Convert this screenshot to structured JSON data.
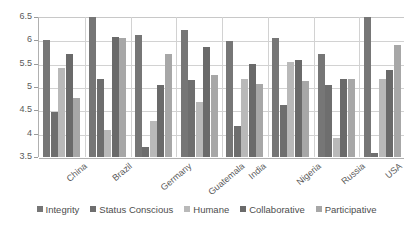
{
  "chart_data": {
    "type": "bar",
    "title": "",
    "subtitle": "",
    "xlabel": "",
    "ylabel": "",
    "ylim": [
      3.5,
      6.5
    ],
    "yticks": [
      "3.5",
      "4",
      "4.5",
      "5",
      "5.5",
      "6",
      "6.5"
    ],
    "ytick_values": [
      3.5,
      4,
      4.5,
      5,
      5.5,
      6,
      6.5
    ],
    "grid": true,
    "legend_position": "bottom",
    "orientation": "vertical",
    "grouped": true,
    "note": "Integrity bars for Brazil and USA are clipped at the 6.5 axis maximum",
    "categories": [
      "China",
      "Brazil",
      "Germany",
      "Guatemala",
      "India",
      "Nigeria",
      "Russia",
      "USA"
    ],
    "series": [
      {
        "name": "Integrity",
        "color": "#767676",
        "values": [
          6.0,
          6.5,
          6.12,
          6.23,
          5.99,
          6.06,
          5.71,
          6.5
        ]
      },
      {
        "name": "Status Conscious",
        "color": "#6e6e6e",
        "values": [
          4.47,
          5.17,
          3.72,
          5.16,
          4.17,
          4.61,
          5.05,
          3.59
        ]
      },
      {
        "name": "Humane",
        "color": "#b9b9b9",
        "values": [
          5.4,
          4.08,
          4.27,
          4.68,
          5.17,
          5.53,
          3.91,
          5.18
        ]
      },
      {
        "name": "Collaborative",
        "color": "#6a6a6a",
        "values": [
          5.71,
          6.08,
          5.05,
          5.86,
          5.5,
          5.58,
          5.18,
          5.37
        ]
      },
      {
        "name": "Participative",
        "color": "#a7a7a7",
        "values": [
          4.77,
          6.04,
          5.71,
          5.25,
          5.07,
          5.12,
          5.17,
          5.89
        ]
      }
    ]
  }
}
